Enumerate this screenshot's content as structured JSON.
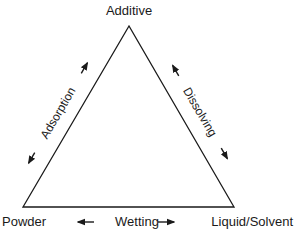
{
  "diagram": {
    "type": "triangle",
    "vertices": {
      "top": {
        "label": "Additive"
      },
      "bottom_left": {
        "label": "Powder"
      },
      "bottom_right": {
        "label": "Liquid/Solvent"
      }
    },
    "edges": {
      "left": {
        "label": "Adsorption",
        "connects": [
          "Powder",
          "Additive"
        ],
        "arrows": "bidirectional"
      },
      "right": {
        "label": "Dissolving",
        "connects": [
          "Additive",
          "Liquid/Solvent"
        ],
        "arrows": "bidirectional"
      },
      "bottom": {
        "label": "Wetting",
        "connects": [
          "Powder",
          "Liquid/Solvent"
        ],
        "arrows": "bidirectional"
      }
    },
    "colors": {
      "line": "#1a1a1a",
      "background": "#ffffff"
    }
  }
}
